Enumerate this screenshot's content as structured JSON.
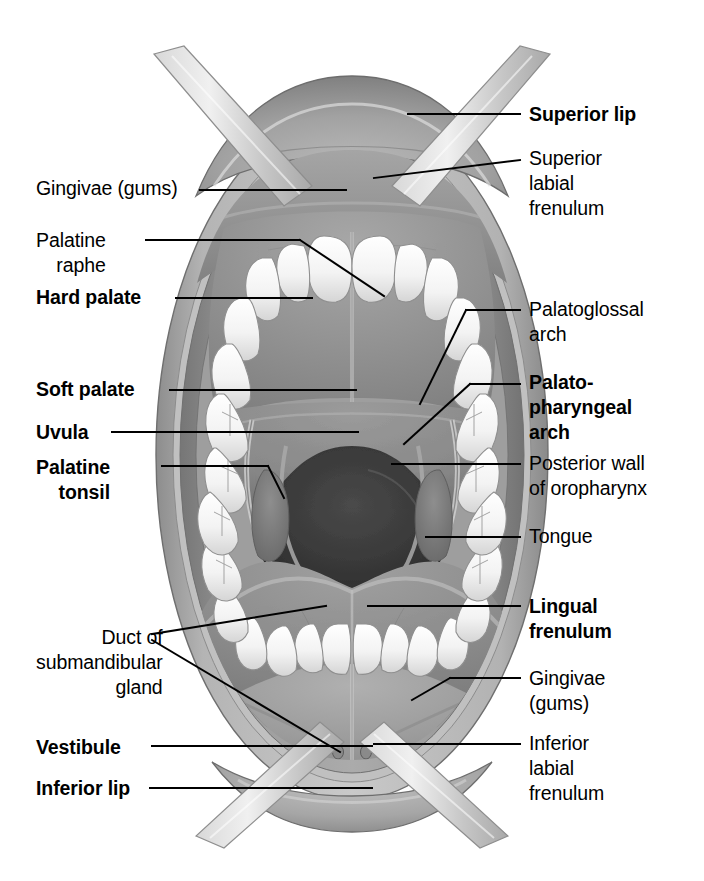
{
  "figure": {
    "background_color": "#ffffff",
    "label_color": "#000000",
    "leader_line_color": "#000000",
    "width": 704,
    "height": 881
  },
  "labels_left": [
    {
      "id": "gingivae-superior",
      "text": "Gingivae (gums)",
      "bold": false,
      "x": 36,
      "y": 176,
      "align": "left"
    },
    {
      "id": "palatine-raphe",
      "text": "Palatine\nraphe",
      "bold": false,
      "x": 36,
      "y": 228,
      "align": "left"
    },
    {
      "id": "hard-palate",
      "text": "Hard palate",
      "bold": true,
      "x": 36,
      "y": 285,
      "align": "left"
    },
    {
      "id": "soft-palate",
      "text": "Soft palate",
      "bold": true,
      "x": 36,
      "y": 377,
      "align": "left"
    },
    {
      "id": "uvula",
      "text": "Uvula",
      "bold": true,
      "x": 36,
      "y": 420,
      "align": "left"
    },
    {
      "id": "palatine-tonsil",
      "text": "Palatine\ntonsil",
      "bold": true,
      "x": 36,
      "y": 455,
      "align": "left"
    },
    {
      "id": "duct-submandibular-gland",
      "text": "Duct of\nsubmandibular\ngland",
      "bold": false,
      "x": 36,
      "y": 625,
      "align": "left"
    },
    {
      "id": "vestibule",
      "text": "Vestibule",
      "bold": true,
      "x": 36,
      "y": 735,
      "align": "left"
    },
    {
      "id": "inferior-lip",
      "text": "Inferior lip",
      "bold": true,
      "x": 36,
      "y": 776,
      "align": "left"
    }
  ],
  "labels_right": [
    {
      "id": "superior-lip",
      "text": "Superior lip",
      "bold": true,
      "x": 529,
      "y": 102,
      "align": "left"
    },
    {
      "id": "superior-labial-frenulum",
      "text": "Superior\nlabial\nfrenulum",
      "bold": false,
      "x": 529,
      "y": 146,
      "align": "left"
    },
    {
      "id": "palatoglossal-arch",
      "text": "Palatoglossal\narch",
      "bold": false,
      "x": 529,
      "y": 297,
      "align": "left"
    },
    {
      "id": "palatopharyngeal-arch",
      "text": "Palato-\npharyngeal\narch",
      "bold": true,
      "x": 529,
      "y": 370,
      "align": "left"
    },
    {
      "id": "posterior-wall-oropharynx",
      "text": "Posterior wall\nof oropharynx",
      "bold": false,
      "x": 529,
      "y": 451,
      "align": "left"
    },
    {
      "id": "tongue",
      "text": "Tongue",
      "bold": false,
      "x": 529,
      "y": 524,
      "align": "left"
    },
    {
      "id": "lingual-frenulum",
      "text": "Lingual\nfrenulum",
      "bold": true,
      "x": 529,
      "y": 594,
      "align": "left"
    },
    {
      "id": "gingivae-inferior",
      "text": "Gingivae\n(gums)",
      "bold": false,
      "x": 529,
      "y": 666,
      "align": "left"
    },
    {
      "id": "inferior-labial-frenulum",
      "text": "Inferior\nlabial\nfrenulum",
      "bold": false,
      "x": 529,
      "y": 731,
      "align": "left"
    }
  ],
  "structures": [
    "superior lip",
    "inferior lip",
    "gingivae (gums)",
    "hard palate",
    "soft palate",
    "palatine raphe",
    "uvula",
    "palatine tonsil",
    "palatoglossal arch",
    "palatopharyngeal arch",
    "posterior wall of oropharynx",
    "tongue",
    "lingual frenulum",
    "superior labial frenulum",
    "inferior labial frenulum",
    "duct of submandibular gland",
    "vestibule",
    "lip retractors"
  ]
}
